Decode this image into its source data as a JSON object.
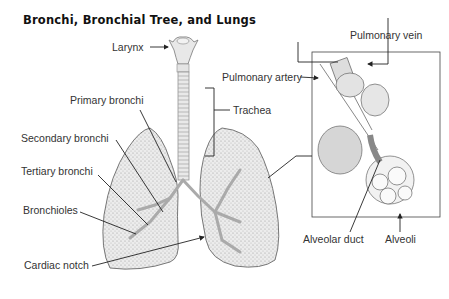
{
  "title": "Bronchi, Bronchial Tree, and Lungs",
  "labels": {
    "larynx": "Larynx",
    "trachea": "Trachea",
    "primary_bronchi": "Primary bronchi",
    "secondary_bronchi": "Secondary bronchi",
    "tertiary_bronchi": "Tertiary bronchi",
    "bronchioles": "Bronchioles",
    "cardiac_notch": "Cardiac notch",
    "pulmonary_vein": "Pulmonary vein",
    "pulmonary_artery": "Pulmonary artery",
    "alveolar_duct": "Alveolar duct",
    "alveoli": "Alveoli"
  },
  "colors": {
    "line": "#222222",
    "lung_fill": "#e6e6e6",
    "lung_stroke": "#777777",
    "text": "#333333"
  }
}
